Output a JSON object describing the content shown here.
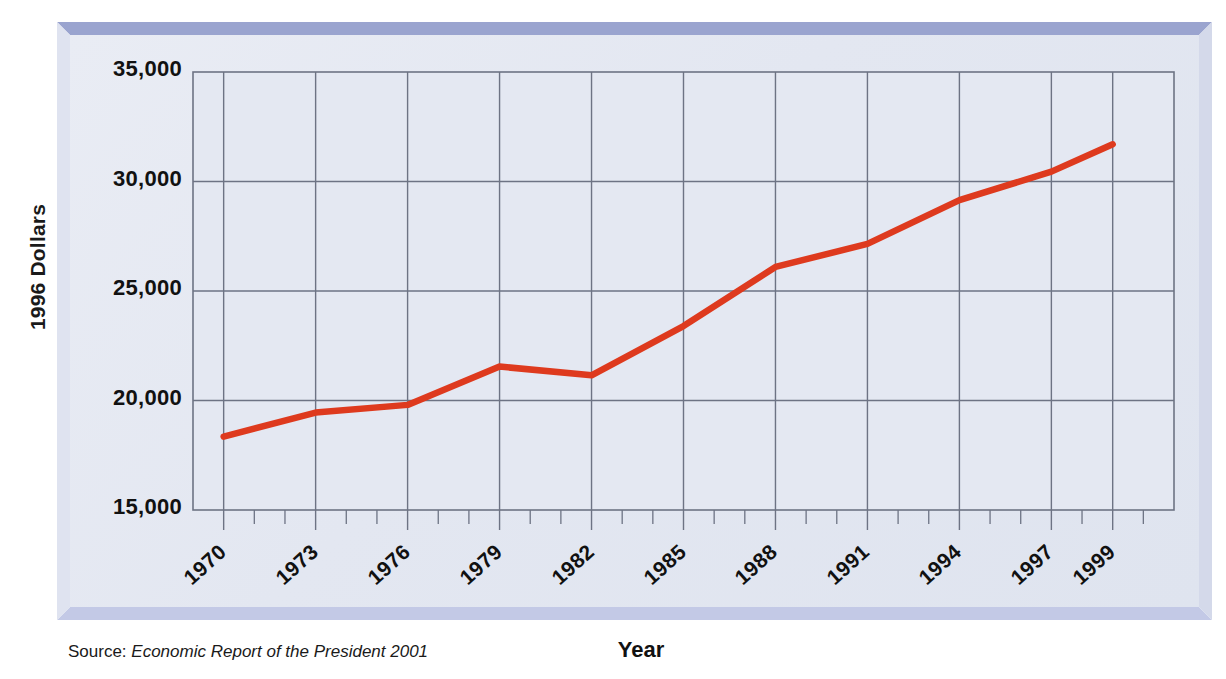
{
  "figure": {
    "y_axis_title": "1996 Dollars",
    "x_axis_title": "Year",
    "source_prefix": "Source:",
    "source_title": "Economic Report of the President 2001",
    "line_color": "#de3a1e",
    "plot_background": "#e4e8f2",
    "grid_color": "#6d7384",
    "frame_top_color": "#9aa4cf",
    "frame_bottom_color": "#c3c9e6"
  },
  "chart_data": {
    "type": "line",
    "title": "",
    "xlabel": "Year",
    "ylabel": "1996 Dollars",
    "xlim": [
      1969,
      2001
    ],
    "ylim": [
      15000,
      35000
    ],
    "grid": true,
    "legend": "none",
    "ytick_labels": [
      "35,000",
      "30,000",
      "25,000",
      "20,000",
      "15,000"
    ],
    "ytick_values": [
      35000,
      30000,
      25000,
      20000,
      15000
    ],
    "xtick_labels": [
      "1970",
      "1973",
      "1976",
      "1979",
      "1982",
      "1985",
      "1988",
      "1991",
      "1994",
      "1997",
      "1999"
    ],
    "xtick_values": [
      1970,
      1973,
      1976,
      1979,
      1982,
      1985,
      1988,
      1991,
      1994,
      1997,
      1999
    ],
    "minor_xticks_every": 1,
    "series": [
      {
        "name": "Real income per capita",
        "color": "#de3a1e",
        "x": [
          1970,
          1973,
          1976,
          1979,
          1982,
          1985,
          1988,
          1991,
          1994,
          1997,
          1999
        ],
        "values": [
          18350,
          19450,
          19800,
          21550,
          21150,
          23400,
          26100,
          27150,
          29150,
          30450,
          31700
        ]
      }
    ]
  }
}
